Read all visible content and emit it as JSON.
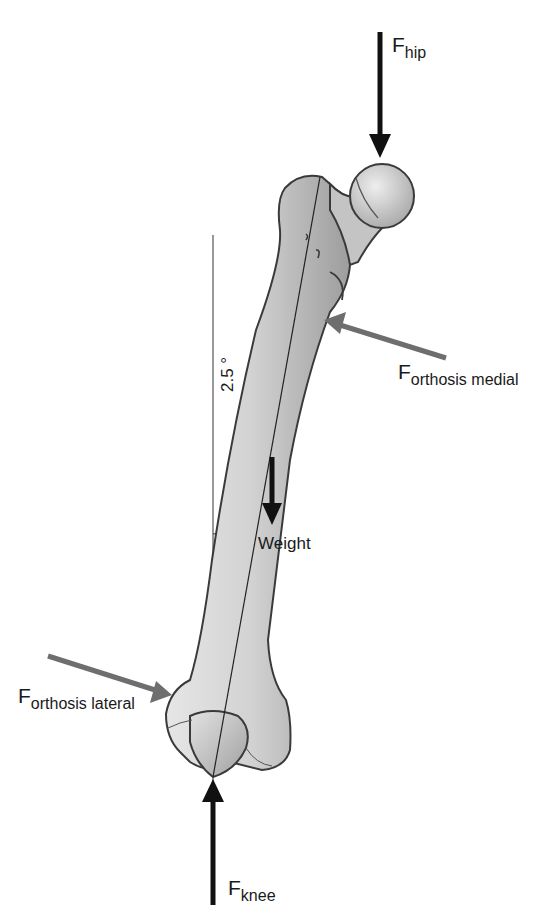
{
  "figure": {
    "forces": {
      "hip": {
        "main": "F",
        "sub": "hip"
      },
      "orthosis_medial": {
        "main": "F",
        "sub": "orthosis medial"
      },
      "orthosis_lateral": {
        "main": "F",
        "sub": "orthosis lateral"
      },
      "knee": {
        "main": "F",
        "sub": "knee"
      },
      "weight": "Weight"
    },
    "angle_label": "2.5 °",
    "colors": {
      "black_arrow": "#111111",
      "gray_arrow": "#6e6e6e",
      "bone_fill": "#c9c9c9",
      "bone_outline": "#3a3a3a"
    }
  }
}
